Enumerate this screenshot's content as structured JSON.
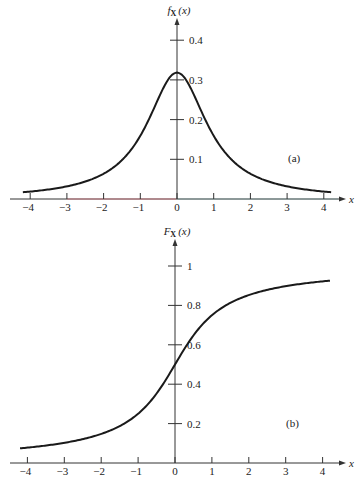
{
  "chart_data": [
    {
      "type": "line",
      "panel_label": "(a)",
      "title": "",
      "xlabel": "x",
      "ylabel": "f_X(x)",
      "ylabel_main": "f",
      "ylabel_sub": "X",
      "ylabel_arg": "(x)",
      "function": "Cauchy density f(x) = 1/(π(1+x²))",
      "xlim": [
        -4.2,
        4.2
      ],
      "ylim": [
        0,
        0.43
      ],
      "xticks": [
        -4,
        -3,
        -2,
        -1,
        0,
        1,
        2,
        3,
        4
      ],
      "xtick_labels": [
        "−4",
        "−3",
        "−2",
        "−1",
        "0",
        "1",
        "2",
        "3",
        "4"
      ],
      "yticks": [
        0.1,
        0.2,
        0.3,
        0.4
      ],
      "ytick_labels": [
        "0.1",
        "0.2",
        "0.3",
        "0.4"
      ],
      "grid": false,
      "x": [
        -4.2,
        -4,
        -3.5,
        -3,
        -2.5,
        -2,
        -1.5,
        -1,
        -0.75,
        -0.5,
        -0.25,
        0,
        0.25,
        0.5,
        0.75,
        1,
        1.5,
        2,
        2.5,
        3,
        3.5,
        4,
        4.2
      ],
      "values": [
        0.017,
        0.019,
        0.024,
        0.032,
        0.044,
        0.064,
        0.098,
        0.159,
        0.204,
        0.255,
        0.3,
        0.318,
        0.3,
        0.255,
        0.204,
        0.159,
        0.098,
        0.064,
        0.044,
        0.032,
        0.024,
        0.019,
        0.017
      ],
      "layout": {
        "origin_px": [
          177,
          199
        ],
        "x_unit_px": 36.7,
        "y_unit_px": 397,
        "x_axis_px": [
          10,
          338
        ],
        "y_axis_top_px": 22
      }
    },
    {
      "type": "line",
      "panel_label": "(b)",
      "title": "",
      "xlabel": "x",
      "ylabel": "F_X(x)",
      "ylabel_main": "F",
      "ylabel_sub": "X",
      "ylabel_arg": "(x)",
      "function": "Cauchy distribution F(x) = 1/2 + arctan(x)/π",
      "xlim": [
        -4.2,
        4.2
      ],
      "ylim": [
        0,
        1.07
      ],
      "xticks": [
        -4,
        -3,
        -2,
        -1,
        0,
        1,
        2,
        3,
        4
      ],
      "xtick_labels": [
        "−4",
        "−3",
        "−2",
        "−1",
        "0",
        "1",
        "2",
        "3",
        "4"
      ],
      "yticks": [
        0.2,
        0.4,
        0.6,
        0.8,
        1
      ],
      "ytick_labels": [
        "0.2",
        "0.4",
        "0.6",
        "0.8",
        "1"
      ],
      "grid": false,
      "x": [
        -4.2,
        -4,
        -3.5,
        -3,
        -2.5,
        -2,
        -1.5,
        -1,
        -0.75,
        -0.5,
        -0.25,
        0,
        0.25,
        0.5,
        0.75,
        1,
        1.5,
        2,
        2.5,
        3,
        3.5,
        4,
        4.2
      ],
      "values": [
        0.074,
        0.078,
        0.088,
        0.102,
        0.121,
        0.148,
        0.187,
        0.25,
        0.295,
        0.352,
        0.422,
        0.5,
        0.578,
        0.648,
        0.705,
        0.75,
        0.813,
        0.852,
        0.879,
        0.898,
        0.912,
        0.922,
        0.926
      ],
      "layout": {
        "origin_px": [
          175,
          463
        ],
        "x_unit_px": 36.9,
        "y_unit_px": 197,
        "x_axis_px": [
          10,
          338
        ],
        "y_axis_top_px": 243
      }
    }
  ],
  "colors": {
    "ink": "#1a1a1a",
    "axis": "#333333",
    "axis_tint_left": "#d9707a",
    "axis_tint_right": "#6a9a9a",
    "background": "#ffffff"
  }
}
